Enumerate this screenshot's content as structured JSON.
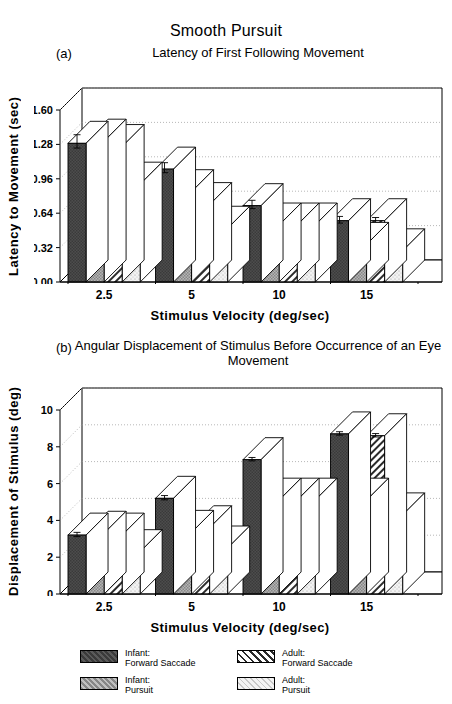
{
  "figure": {
    "main_title": "Smooth Pursuit",
    "panel_a_label": "(a)",
    "panel_a_subtitle": "Latency of First Following Movement",
    "panel_b_label": "(b)",
    "panel_b_subtitle": "Angular Displacement of Stimulus\nBefore Occurrence of an Eye Movement"
  },
  "legend": {
    "items": [
      {
        "name": "infant-forward-saccade",
        "label": "Infant:\nForward Saccade",
        "pattern": "dark-solid",
        "color": "#4a4a4a"
      },
      {
        "name": "adult-forward-saccade",
        "label": "Adult:\nForward Saccade",
        "pattern": "diagonal-hatch",
        "color": "#ffffff"
      },
      {
        "name": "infant-pursuit",
        "label": "Infant:\nPursuit",
        "pattern": "medium-checker",
        "color": "#9a9a9a"
      },
      {
        "name": "adult-pursuit",
        "label": "Adult:\nPursuit",
        "pattern": "light-stipple",
        "color": "#e8e8e8"
      }
    ]
  },
  "chart_data": [
    {
      "id": "panel-a",
      "type": "bar",
      "title": "Latency of First Following Movement",
      "panel": "(a)",
      "xlabel": "Stimulus Velocity (deg/sec)",
      "ylabel": "Latency to Movement (sec)",
      "categories": [
        "2.5",
        "5",
        "10",
        "15"
      ],
      "yticks": [
        "0.00",
        "0.32",
        "0.64",
        "0.96",
        "1.28",
        "1.60"
      ],
      "ylim": [
        0.0,
        1.6
      ],
      "grid": true,
      "legend_position": "below-figure",
      "series": [
        {
          "name": "Infant: Forward Saccade",
          "values": [
            1.29,
            1.05,
            0.71,
            0.57
          ],
          "errors": [
            0.08,
            0.06,
            0.05,
            0.04
          ]
        },
        {
          "name": "Infant: Pursuit",
          "values": [
            1.31,
            0.84,
            0.53,
            0.35
          ],
          "errors": [
            0.09,
            0.07,
            0.05,
            0.03
          ]
        },
        {
          "name": "Adult: Forward Saccade",
          "values": [
            1.26,
            0.72,
            0.53,
            0.57
          ],
          "errors": [
            0.18,
            0.07,
            0.04,
            0.03
          ]
        },
        {
          "name": "Adult: Pursuit",
          "values": [
            0.91,
            0.5,
            0.53,
            0.29
          ],
          "errors": [
            0.1,
            0.07,
            0.05,
            0.03
          ]
        }
      ]
    },
    {
      "id": "panel-b",
      "type": "bar",
      "title": "Angular Displacement of Stimulus Before Occurrence of an Eye Movement",
      "panel": "(b)",
      "xlabel": "Stimulus Velocity (deg/sec)",
      "ylabel": "Displacement of Stimulus (deg)",
      "categories": [
        "2.5",
        "5",
        "10",
        "15"
      ],
      "yticks": [
        "0",
        "2",
        "4",
        "6",
        "8",
        "10"
      ],
      "ylim": [
        0,
        10
      ],
      "grid": true,
      "legend_position": "below-figure",
      "series": [
        {
          "name": "Infant: Forward Saccade",
          "values": [
            3.2,
            5.2,
            7.3,
            8.7
          ],
          "errors": [
            0.15,
            0.15,
            0.12,
            0.12
          ]
        },
        {
          "name": "Infant: Pursuit",
          "values": [
            3.3,
            3.35,
            5.1,
            5.1
          ],
          "errors": [
            0.2,
            0.15,
            0.12,
            0.12
          ]
        },
        {
          "name": "Adult: Forward Saccade",
          "values": [
            3.2,
            3.6,
            5.1,
            8.6
          ],
          "errors": [
            0.3,
            0.12,
            0.12,
            0.12
          ]
        },
        {
          "name": "Adult: Pursuit",
          "values": [
            2.3,
            2.5,
            5.1,
            4.3
          ],
          "errors": [
            0.2,
            0.12,
            0.12,
            0.1
          ]
        }
      ]
    }
  ]
}
